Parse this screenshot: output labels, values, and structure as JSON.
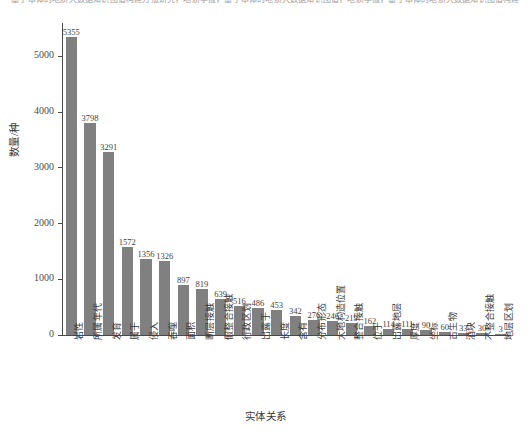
{
  "top_strip_text": "基于本体的地质大数据知识图谱构建方法研究，地质学报，基于本体的地质大数据知识图谱，地质学报，基于本体的地质大数据知识图谱构建",
  "chart_data": {
    "type": "bar",
    "title": "",
    "xlabel": "实体关系",
    "ylabel": "数量/种",
    "ylim": [
      0,
      5600
    ],
    "yticks": [
      0,
      1000,
      2000,
      3000,
      4000,
      5000
    ],
    "ytick_labels": [
      "0",
      "1000",
      "2000",
      "3000",
      "4000",
      "5000"
    ],
    "grid": false,
    "legend": null,
    "bar_color": "#808080",
    "categories": [
      "岩性",
      "所属年代",
      "发育",
      "属于",
      "侵入",
      "吞噬",
      "面积",
      "断层接触",
      "假整合接触",
      "行政区划",
      "出露于",
      "长度",
      "含有",
      "分布形态",
      "大地构造位置",
      "整合接触",
      "位于",
      "出露地层",
      "厚度",
      "坐标",
      "古生物",
      "酒块",
      "不整合接触",
      "地层区划"
    ],
    "values": [
      5355,
      3798,
      3291,
      1572,
      1356,
      1326,
      897,
      819,
      639,
      516,
      486,
      453,
      342,
      276,
      246,
      219,
      162,
      114,
      111,
      90,
      60,
      33,
      30,
      3
    ],
    "value_labels": [
      "5355",
      "3798",
      "3291",
      "1572",
      "1356",
      "1326",
      "897",
      "819",
      "639",
      "516",
      "486",
      "453",
      "342",
      "276",
      "246",
      "219",
      "162",
      "114",
      "111",
      "90",
      "60",
      "33",
      "30",
      "3"
    ]
  }
}
